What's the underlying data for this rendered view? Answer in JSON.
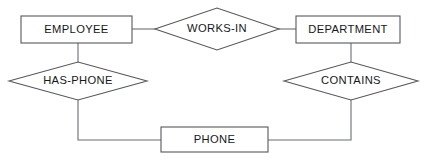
{
  "diagram": {
    "type": "entity-relationship-diagram",
    "title": "",
    "background_color": "#ffffff",
    "shape_fill": "#ffffff",
    "shape_stroke": "#55585c",
    "connector_color": "#6a6d71",
    "text_color": "#15171a",
    "entities": [
      {
        "id": "employee",
        "label": "EMPLOYEE",
        "shape": "rectangle",
        "x": 21,
        "y": 16,
        "width": 111,
        "height": 27
      },
      {
        "id": "department",
        "label": "DEPARTMENT",
        "shape": "rectangle",
        "x": 296,
        "y": 16,
        "width": 104,
        "height": 27
      },
      {
        "id": "phone",
        "label": "PHONE",
        "shape": "rectangle",
        "x": 161,
        "y": 127,
        "width": 107,
        "height": 25
      }
    ],
    "relationships": [
      {
        "id": "works-in",
        "label": "WORKS-IN",
        "shape": "diamond",
        "cx": 217,
        "cy": 29,
        "half_width": 62,
        "half_height": 21
      },
      {
        "id": "has-phone",
        "label": "HAS-PHONE",
        "shape": "diamond",
        "cx": 78,
        "cy": 81,
        "half_width": 69,
        "half_height": 19
      },
      {
        "id": "contains",
        "label": "CONTAINS",
        "shape": "diamond",
        "cx": 351,
        "cy": 81,
        "half_width": 67,
        "half_height": 19
      }
    ],
    "connectors": [
      {
        "id": "employee-works-in",
        "from": "employee",
        "to": "works-in",
        "path": "M 132 29 L 156 29"
      },
      {
        "id": "works-in-department",
        "from": "works-in",
        "to": "department",
        "path": "M 279 29 L 296 29"
      },
      {
        "id": "employee-has-phone",
        "from": "employee",
        "to": "has-phone",
        "path": "M 78 43 L 78 62"
      },
      {
        "id": "department-contains",
        "from": "department",
        "to": "contains",
        "path": "M 351 43 L 351 62"
      },
      {
        "id": "has-phone-phone",
        "from": "has-phone",
        "to": "phone",
        "path": "M 78 100 L 78 140 L 161 140"
      },
      {
        "id": "contains-phone",
        "from": "contains",
        "to": "phone",
        "path": "M 351 100 L 351 140 L 268 140"
      }
    ]
  }
}
